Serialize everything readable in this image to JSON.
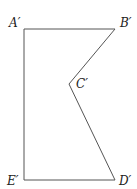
{
  "diagram": {
    "type": "polygon",
    "stroke_color": "#555555",
    "vertices": [
      {
        "label": "A′",
        "x": 24,
        "y": 29
      },
      {
        "label": "B′",
        "x": 115,
        "y": 29
      },
      {
        "label": "C′",
        "x": 69,
        "y": 84
      },
      {
        "label": "D′",
        "x": 115,
        "y": 180
      },
      {
        "label": "E′",
        "x": 24,
        "y": 180
      }
    ]
  }
}
